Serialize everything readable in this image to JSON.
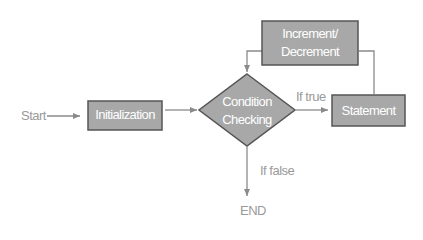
{
  "diagram": {
    "colors": {
      "box_fill": "#a8a8a8",
      "box_border": "#555555",
      "arrow": "#8a8a8a",
      "label": "#9a9a9a",
      "box_text": "#ffffff"
    },
    "nodes": {
      "start": {
        "label": "Start"
      },
      "initialization": {
        "label": "Initialization"
      },
      "condition": {
        "line1": "Condition",
        "line2": "Checking"
      },
      "statement": {
        "label": "Statement"
      },
      "increment": {
        "line1": "Increment/",
        "line2": "Decrement"
      },
      "end": {
        "label": "END"
      }
    },
    "edges": {
      "true_label": "If true",
      "false_label": "If false"
    }
  }
}
